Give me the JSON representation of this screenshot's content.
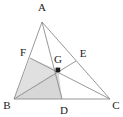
{
  "figure": {
    "type": "geometry-diagram",
    "background_color": "#ffffff",
    "line_color": "#8c8c8c",
    "shade_color": "#d9d9d9",
    "shade_color_light": "#e3e3e3",
    "point_color": "#1a1a1a",
    "label_color": "#1a1a1a"
  },
  "points": {
    "A": {
      "label": "A",
      "x": 42,
      "y": 22,
      "label_x": 42,
      "label_y": 11
    },
    "B": {
      "label": "B",
      "x": 14,
      "y": 99,
      "label_x": 7,
      "label_y": 109
    },
    "C": {
      "label": "C",
      "x": 110,
      "y": 99,
      "label_x": 115,
      "label_y": 109
    },
    "D": {
      "label": "D",
      "x": 62,
      "y": 99,
      "label_x": 63,
      "label_y": 113
    },
    "E": {
      "label": "E",
      "x": 76,
      "y": 61,
      "label_x": 82,
      "label_y": 56
    },
    "F": {
      "label": "F",
      "x": 30,
      "y": 58,
      "label_x": 23,
      "label_y": 55
    },
    "G": {
      "label": "G",
      "x": 58,
      "y": 70,
      "label_x": 57,
      "label_y": 62
    }
  },
  "segments": [
    {
      "name": "side-AB",
      "from": "A",
      "to": "B"
    },
    {
      "name": "side-BC",
      "from": "B",
      "to": "C"
    },
    {
      "name": "side-CA",
      "from": "C",
      "to": "A"
    },
    {
      "name": "cevian-AD",
      "from": "A",
      "to": "D"
    },
    {
      "name": "cevian-BE",
      "from": "B",
      "to": "E"
    },
    {
      "name": "cevian-CF",
      "from": "C",
      "to": "F"
    }
  ],
  "shaded_regions": [
    {
      "name": "region-BFGD",
      "vertices": [
        "B",
        "F",
        "G",
        "D"
      ]
    },
    {
      "name": "region-BGD",
      "vertices": [
        "B",
        "G",
        "D"
      ]
    }
  ],
  "marked_points": [
    "G"
  ]
}
